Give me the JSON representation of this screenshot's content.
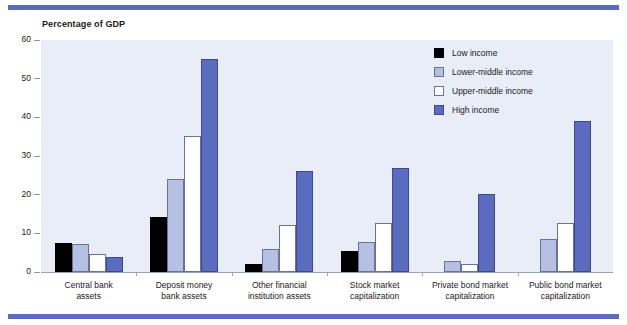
{
  "chart_data": {
    "type": "bar",
    "title": "Percentage of GDP",
    "xlabel": "",
    "ylabel": "Percentage of GDP",
    "ylim": [
      0,
      60
    ],
    "yticks": [
      0,
      10,
      20,
      30,
      40,
      50,
      60
    ],
    "grid": false,
    "legend_position": "top-right",
    "categories": [
      "Central bank assets",
      "Deposit money bank assets",
      "Other financial institution assets",
      "Stock market capitalization",
      "Private bond market capitalization",
      "Public bond market capitalization"
    ],
    "category_lines": [
      [
        "Central bank",
        "assets"
      ],
      [
        "Deposit money",
        "bank assets"
      ],
      [
        "Other financial",
        "institution assets"
      ],
      [
        "Stock market",
        "capitalization"
      ],
      [
        "Private bond market",
        "capitalization"
      ],
      [
        "Public bond market",
        "capitalization"
      ]
    ],
    "series": [
      {
        "name": "Low income",
        "color": "#000000",
        "values": [
          7.5,
          14.3,
          2.1,
          5.5,
          0,
          0
        ]
      },
      {
        "name": "Lower-middle income",
        "color": "#b6c0e2",
        "values": [
          7.3,
          24.0,
          6.0,
          7.8,
          2.8,
          8.6
        ]
      },
      {
        "name": "Upper-middle income",
        "color": "#ffffff",
        "values": [
          4.6,
          35.2,
          12.2,
          12.6,
          2.0,
          12.6
        ]
      },
      {
        "name": "High income",
        "color": "#5b6bbf",
        "values": [
          3.9,
          55.2,
          26.2,
          26.8,
          20.3,
          39.0
        ]
      }
    ]
  },
  "colors": {
    "accent_rule": "#5b6bbf",
    "plot_background": "#e9edf7",
    "axis": "#9aa1b3"
  }
}
